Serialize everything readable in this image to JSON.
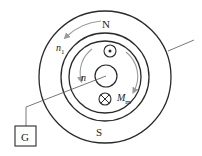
{
  "diagram": {
    "title": "",
    "labels": {
      "north": "N",
      "south": "S",
      "stator_speed": "n",
      "stator_speed_sub": "1",
      "rotor_speed": "n",
      "torque": "M",
      "torque_sub": "m",
      "galvanometer": "G"
    },
    "elements": {
      "outer_stator_ring": "outer circle",
      "middle_ring": "middle circle",
      "inner_ring": "inner circle",
      "rotor_shaft": "central circle",
      "conductor_out": "dot (current out of page)",
      "conductor_in": "cross (current into page)"
    },
    "colors": {
      "line": "#2a2a2a",
      "arrow": "#9a9a9a"
    }
  }
}
